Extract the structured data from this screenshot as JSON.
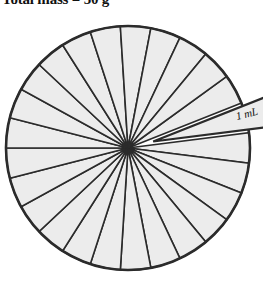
{
  "caption": {
    "text": "Total mass = 50 g"
  },
  "colors": {
    "wedge_fill": "#ececec",
    "outline": "#2b2b2b",
    "background": "#ffffff",
    "text": "#111111"
  },
  "diagram": {
    "name": "pie-of-equal-wedges",
    "center_x": 128,
    "center_y": 148,
    "radius": 122,
    "wedge_count": 25,
    "wedge_angle_deg": 14.4,
    "exploded_wedge": {
      "label": "1 mL",
      "index": 1,
      "offset_px": 26,
      "direction_deg": 68
    }
  },
  "chart_data": {
    "type": "pie",
    "title": "Total mass = 50 g",
    "xlabel": "",
    "ylabel": "",
    "categories": [
      "1 mL",
      "2",
      "3",
      "4",
      "5",
      "6",
      "7",
      "8",
      "9",
      "10",
      "11",
      "12",
      "13",
      "14",
      "15",
      "16",
      "17",
      "18",
      "19",
      "20",
      "21",
      "22",
      "23",
      "24",
      "25"
    ],
    "values": [
      4,
      4,
      4,
      4,
      4,
      4,
      4,
      4,
      4,
      4,
      4,
      4,
      4,
      4,
      4,
      4,
      4,
      4,
      4,
      4,
      4,
      4,
      4,
      4,
      4
    ],
    "units": "percent",
    "annotations": [
      "1 mL"
    ],
    "legend": "none",
    "grid": false
  }
}
